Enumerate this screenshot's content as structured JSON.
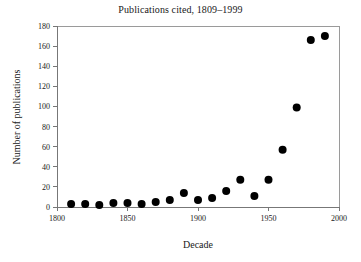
{
  "chart_data": {
    "type": "scatter",
    "title": "Publications cited, 1809–1999",
    "xlabel": "Decade",
    "ylabel": "Number of publications",
    "xlim": [
      1800,
      2000
    ],
    "ylim": [
      0,
      180
    ],
    "xticks": [
      1800,
      1850,
      1900,
      1950,
      2000
    ],
    "xtick_labels": [
      "1800",
      "1850",
      "1900",
      "1950",
      "2000"
    ],
    "yticks": [
      0,
      20,
      40,
      60,
      80,
      100,
      120,
      140,
      160,
      180
    ],
    "ytick_labels": [
      "0",
      "20",
      "40",
      "60",
      "80",
      "100",
      "120",
      "140",
      "160",
      "180"
    ],
    "grid": false,
    "legend": false,
    "marker": "filled-circle",
    "marker_color": "#000000",
    "marker_size": 4,
    "x": [
      1810,
      1820,
      1830,
      1840,
      1850,
      1860,
      1870,
      1880,
      1890,
      1900,
      1910,
      1920,
      1930,
      1940,
      1950,
      1960,
      1970,
      1980,
      1990
    ],
    "y": [
      3,
      3,
      2,
      4,
      4,
      3,
      5,
      7,
      14,
      7,
      9,
      16,
      27,
      11,
      27,
      57,
      99,
      166,
      170
    ],
    "points": [
      {
        "x": 1810,
        "y": 3
      },
      {
        "x": 1820,
        "y": 3
      },
      {
        "x": 1830,
        "y": 2
      },
      {
        "x": 1840,
        "y": 4
      },
      {
        "x": 1850,
        "y": 4
      },
      {
        "x": 1860,
        "y": 3
      },
      {
        "x": 1870,
        "y": 5
      },
      {
        "x": 1880,
        "y": 7
      },
      {
        "x": 1890,
        "y": 14
      },
      {
        "x": 1900,
        "y": 7
      },
      {
        "x": 1910,
        "y": 9
      },
      {
        "x": 1920,
        "y": 16
      },
      {
        "x": 1930,
        "y": 27
      },
      {
        "x": 1940,
        "y": 11
      },
      {
        "x": 1950,
        "y": 27
      },
      {
        "x": 1960,
        "y": 57
      },
      {
        "x": 1970,
        "y": 99
      },
      {
        "x": 1980,
        "y": 166
      },
      {
        "x": 1990,
        "y": 170
      }
    ]
  }
}
